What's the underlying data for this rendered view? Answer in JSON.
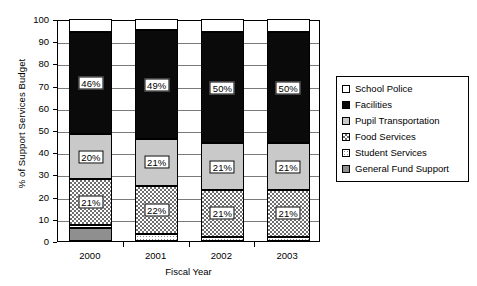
{
  "chart_data": {
    "type": "bar",
    "stacked": true,
    "title": "",
    "xlabel": "Fiscal Year",
    "ylabel": "% of Support Services Budget",
    "categories": [
      "2000",
      "2001",
      "2002",
      "2003"
    ],
    "ylim": [
      0,
      100
    ],
    "yticks": [
      0,
      10,
      20,
      30,
      40,
      50,
      60,
      70,
      80,
      90,
      100
    ],
    "grid": true,
    "legend_position": "right",
    "stack_order_bottom_to_top": [
      "General Fund Support",
      "Student Services",
      "Food Services",
      "Pupil Transportation",
      "Facilities",
      "School Police"
    ],
    "series": [
      {
        "name": "General Fund Support",
        "swatch": "medium-gray",
        "values": [
          6,
          0,
          0,
          0
        ],
        "labels": [
          "",
          "",
          "",
          ""
        ]
      },
      {
        "name": "Student Services",
        "swatch": "white-dots",
        "values": [
          1,
          3,
          2,
          2
        ],
        "labels": [
          "",
          "",
          "",
          ""
        ]
      },
      {
        "name": "Food Services",
        "swatch": "checkered",
        "values": [
          21,
          22,
          21,
          21
        ],
        "labels": [
          "21%",
          "22%",
          "21%",
          "21%"
        ]
      },
      {
        "name": "Pupil Transportation",
        "swatch": "light-gray",
        "values": [
          20,
          21,
          21,
          21
        ],
        "labels": [
          "20%",
          "21%",
          "21%",
          "21%"
        ]
      },
      {
        "name": "Facilities",
        "swatch": "black",
        "values": [
          46,
          49,
          50,
          50
        ],
        "labels": [
          "46%",
          "49%",
          "50%",
          "50%"
        ]
      },
      {
        "name": "School Police",
        "swatch": "white",
        "values": [
          6,
          5,
          6,
          6
        ],
        "labels": [
          "",
          "",
          "",
          ""
        ]
      }
    ]
  },
  "legend": {
    "items": [
      {
        "label": "School Police",
        "swatch": "white"
      },
      {
        "label": "Facilities",
        "swatch": "black"
      },
      {
        "label": "Pupil Transportation",
        "swatch": "light-gray"
      },
      {
        "label": "Food Services",
        "swatch": "checkered"
      },
      {
        "label": "Student Services",
        "swatch": "white-dots"
      },
      {
        "label": "General Fund Support",
        "swatch": "medium-gray"
      }
    ]
  },
  "colors": {
    "black": "#0a0a0a",
    "light_gray": "#c9c9c9",
    "medium_gray": "#8f8f8f",
    "grid": "#7a7a7a",
    "background": "#ffffff"
  }
}
